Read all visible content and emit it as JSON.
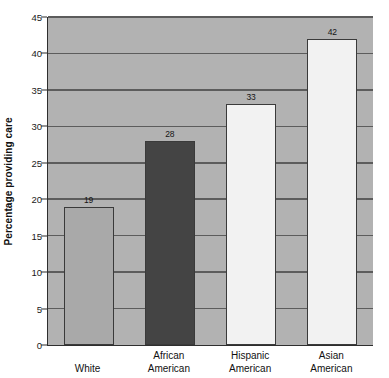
{
  "chart_data": {
    "type": "bar",
    "title": "",
    "subtitle": "",
    "xlabel": "",
    "ylabel": "Percentage providing care",
    "categories": [
      "White",
      "African American",
      "Hispanic American",
      "Asian American"
    ],
    "values": [
      19,
      28,
      33,
      42
    ],
    "value_labels": [
      "19",
      "28",
      "33",
      "42"
    ],
    "ylim": [
      0,
      45
    ],
    "ytick_step": 5,
    "ytick_labels": [
      "0",
      "5",
      "10",
      "15",
      "20",
      "25",
      "30",
      "35",
      "40",
      "45"
    ],
    "ytick_values": [
      0,
      5,
      10,
      15,
      20,
      25,
      30,
      35,
      40,
      45
    ],
    "grid": true,
    "grid_axis": "y",
    "legend": false,
    "legend_position": "none",
    "bar_colors": [
      "#a9a9a9",
      "#444444",
      "#f2f2f2",
      "#f2f2f2"
    ],
    "plot_background": "#b2b2b2",
    "figure_background": "#ffffff",
    "axis_color": "#2e2e2e",
    "gridline_color": "#5c5c5c",
    "bar_edge_color": "#3a3a3a"
  },
  "category_lines": [
    [
      "White"
    ],
    [
      "African",
      "American"
    ],
    [
      "Hispanic",
      "American"
    ],
    [
      "Asian",
      "American"
    ]
  ]
}
